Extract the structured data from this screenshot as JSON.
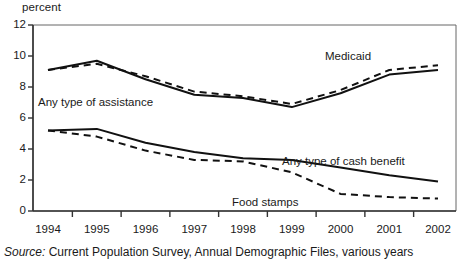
{
  "axis_unit_label": "percent",
  "source_note": {
    "label": "Source:",
    "text": " Current Population Survey, Annual Demographic Files, various years"
  },
  "colors": {
    "line": "#111111",
    "axis": "#555555",
    "background": "#ffffff"
  },
  "y_axis": {
    "ticks": [
      "0",
      "2",
      "4",
      "6",
      "8",
      "10",
      "12"
    ],
    "min": 0,
    "max": 12,
    "step": 2
  },
  "x_axis": {
    "ticks": [
      "1994",
      "1995",
      "1996",
      "1997",
      "1998",
      "1999",
      "2000",
      "2001",
      "2002"
    ]
  },
  "annotations": [
    {
      "name": "medicaid",
      "label": "Medicaid"
    },
    {
      "name": "any-type-of-assistance",
      "label": "Any type of assistance"
    },
    {
      "name": "any-type-of-cash-benefit",
      "label": "Any type of cash benefit"
    },
    {
      "name": "food-stamps",
      "label": "Food stamps"
    }
  ],
  "chart_data": {
    "type": "line",
    "title": "",
    "subtitle": "",
    "xlabel": "",
    "ylabel": "percent",
    "ylim": [
      0,
      12
    ],
    "ytick_step": 2,
    "grid": false,
    "legend": "inline-annotations",
    "x": [
      1994,
      1995,
      1996,
      1997,
      1998,
      1999,
      2000,
      2001,
      2002
    ],
    "categories": [
      "1994",
      "1995",
      "1996",
      "1997",
      "1998",
      "1999",
      "2000",
      "2001",
      "2002"
    ],
    "series": [
      {
        "name": "Any type of assistance",
        "style": "solid",
        "values": [
          9.1,
          9.7,
          8.5,
          7.5,
          7.3,
          6.7,
          7.6,
          8.8,
          9.1
        ]
      },
      {
        "name": "Medicaid",
        "style": "dashed",
        "values": [
          9.1,
          9.5,
          8.7,
          7.7,
          7.4,
          6.9,
          7.8,
          9.1,
          9.4
        ]
      },
      {
        "name": "Any type of cash benefit",
        "style": "solid",
        "values": [
          5.2,
          5.3,
          4.4,
          3.8,
          3.4,
          3.3,
          2.8,
          2.3,
          1.9
        ]
      },
      {
        "name": "Food stamps",
        "style": "dashed",
        "values": [
          5.2,
          4.8,
          3.9,
          3.3,
          3.2,
          2.5,
          1.1,
          0.9,
          0.8
        ]
      }
    ]
  }
}
